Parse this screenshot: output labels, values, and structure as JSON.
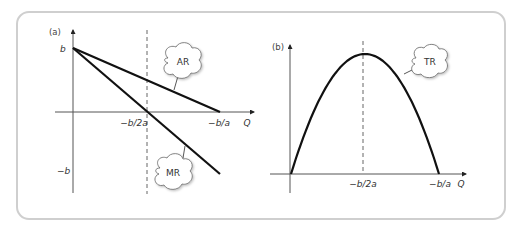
{
  "figure": {
    "panels": [
      {
        "id": "a",
        "label": "(a)",
        "x_axis_label": "Q",
        "y_ticks": {
          "top": "b",
          "bottom": "−b"
        },
        "x_ticks": {
          "mid": "−b/2a",
          "end": "−b/a"
        },
        "curves": [
          {
            "name": "AR",
            "label": "AR",
            "type": "line",
            "from": "b at Q=0",
            "to": "0 at Q=−b/a"
          },
          {
            "name": "MR",
            "label": "MR",
            "type": "line",
            "from": "b at Q=0",
            "to": "−b at Q=−b/a",
            "crosses_zero_at": "−b/2a"
          }
        ]
      },
      {
        "id": "b",
        "label": "(b)",
        "x_axis_label": "Q",
        "x_ticks": {
          "mid": "−b/2a",
          "end": "−b/a"
        },
        "curves": [
          {
            "name": "TR",
            "label": "TR",
            "type": "parabola",
            "zeros": [
              "0",
              "−b/a"
            ],
            "max_at": "−b/2a"
          }
        ]
      }
    ]
  },
  "colors": {
    "curve": "#111111",
    "axis": "#555555",
    "frame": "#cfcfcf",
    "dashed": "#666666"
  }
}
